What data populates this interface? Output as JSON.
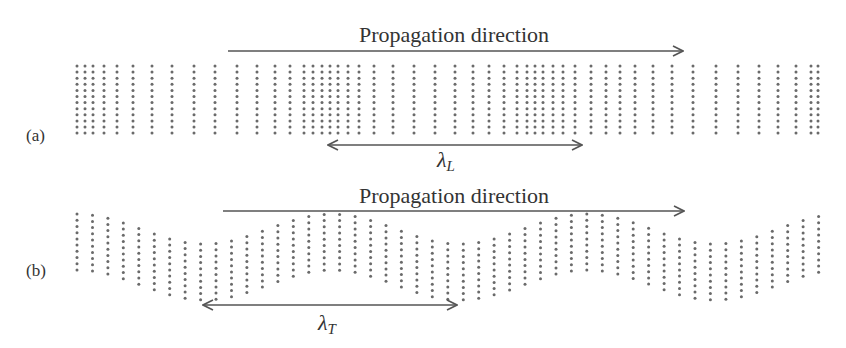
{
  "panels": [
    {
      "id": "a",
      "label": "(a)",
      "kind": "longitudinal",
      "propagation_label": "Propagation direction",
      "propagation_arrow": {
        "x1": 228,
        "x2": 683,
        "y": 51
      },
      "wavelength_label": "λ",
      "wavelength_subscript": "L",
      "wavelength_arrow": {
        "x1": 328,
        "x2": 582,
        "y": 145
      },
      "dots": {
        "columns_x": [
          77,
          85,
          93,
          104,
          117,
          133,
          152,
          172,
          194,
          215,
          237,
          257,
          275,
          290,
          304,
          313,
          322,
          330,
          338,
          348,
          359,
          374,
          393,
          414,
          435,
          455,
          473,
          489,
          504,
          517,
          527,
          535,
          543,
          553,
          563,
          575,
          591,
          606,
          620,
          635,
          653,
          672,
          693,
          716,
          738,
          759,
          778,
          796,
          811,
          818
        ],
        "y_top": 66,
        "rows": 12,
        "row_spacing": 6.1
      }
    },
    {
      "id": "b",
      "label": "(b)",
      "kind": "transverse",
      "propagation_label": "Propagation direction",
      "propagation_arrow": {
        "x1": 223,
        "x2": 684,
        "y": 211
      },
      "wavelength_label": "λ",
      "wavelength_subscript": "T",
      "wavelength_arrow": {
        "x1": 203,
        "x2": 457,
        "y": 305
      },
      "dots": {
        "x_start": 77,
        "x_step": 15.45,
        "count": 49,
        "center_y": 257,
        "amplitude": 15,
        "period": 255,
        "phase_x": 77,
        "rows": 10,
        "row_spacing": 6.2
      }
    }
  ]
}
